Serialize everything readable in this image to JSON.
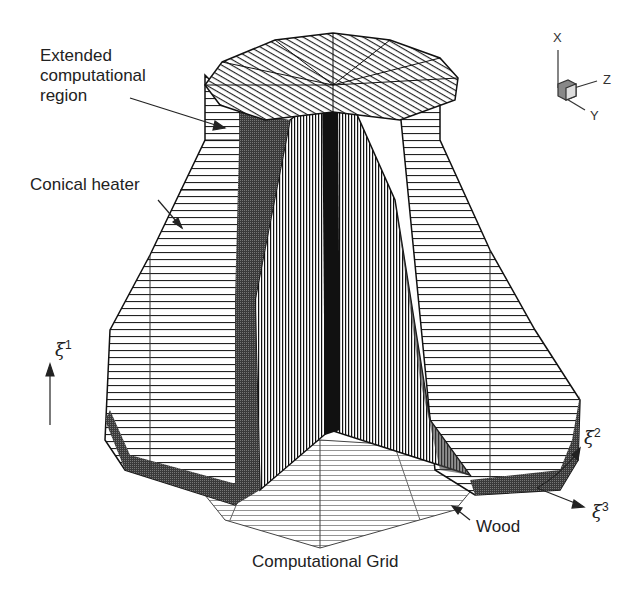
{
  "diagram": {
    "title": "Computational Grid",
    "labels": {
      "extended_region": [
        "Extended",
        "computational",
        "region"
      ],
      "conical_heater": "Conical heater",
      "wood": "Wood"
    },
    "curvilinear_axes": {
      "xi1": {
        "symbol": "ξ",
        "index": "1"
      },
      "xi2": {
        "symbol": "ξ",
        "index": "2"
      },
      "xi3": {
        "symbol": "ξ",
        "index": "3"
      }
    },
    "triad": {
      "x": "X",
      "y": "Y",
      "z": "Z"
    },
    "colors": {
      "mesh": "#1a1a1a",
      "mesh_light": "#555555",
      "background": "#ffffff"
    }
  }
}
